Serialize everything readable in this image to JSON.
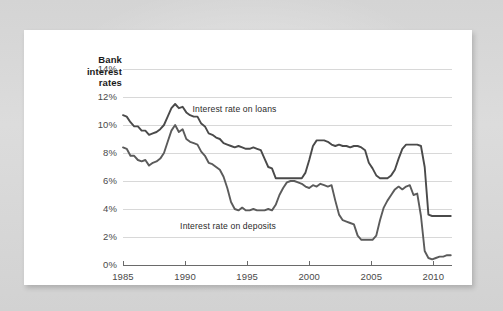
{
  "page": {
    "background_color": "#d9d9d9",
    "paper_color": "#ffffff"
  },
  "chart_data": {
    "type": "line",
    "title": "Bank interest rates",
    "title_lines": [
      "Bank",
      "interest",
      "rates"
    ],
    "xlabel": "",
    "ylabel": "",
    "xlim": [
      1985,
      2011.5
    ],
    "ylim": [
      0,
      14
    ],
    "grid": true,
    "grid_axis": "y",
    "legend_position": "inline-annotations",
    "y_ticks": [
      0,
      2,
      4,
      6,
      8,
      10,
      12,
      14
    ],
    "y_tick_labels": [
      "0%",
      "2%",
      "4%",
      "6%",
      "8%",
      "10%",
      "12%",
      "14%"
    ],
    "x_ticks": [
      1985,
      1990,
      1995,
      2000,
      2005,
      2010
    ],
    "x_tick_labels": [
      "1985",
      "1990",
      "1995",
      "2000",
      "2005",
      "2010"
    ],
    "annotations": [
      {
        "text": "Interest rate on loans",
        "x": 1990.6,
        "y": 11.1
      },
      {
        "text": "Interest rate on deposits",
        "x": 1989.6,
        "y": 2.7
      }
    ],
    "series": [
      {
        "name": "Interest rate on loans",
        "color": "#4a4a4a",
        "x": [
          1985.0,
          1985.3,
          1985.6,
          1985.9,
          1986.2,
          1986.5,
          1986.8,
          1987.1,
          1987.4,
          1987.7,
          1988.0,
          1988.3,
          1988.6,
          1988.9,
          1989.2,
          1989.5,
          1989.8,
          1990.1,
          1990.4,
          1990.7,
          1991.0,
          1991.3,
          1991.6,
          1991.9,
          1992.2,
          1992.5,
          1992.8,
          1993.1,
          1993.4,
          1993.7,
          1994.0,
          1994.3,
          1994.6,
          1994.9,
          1995.2,
          1995.5,
          1995.8,
          1996.1,
          1996.4,
          1996.7,
          1997.0,
          1997.3,
          1997.6,
          1997.9,
          1998.2,
          1998.5,
          1998.8,
          1999.1,
          1999.4,
          1999.7,
          2000.0,
          2000.3,
          2000.6,
          2000.9,
          2001.2,
          2001.5,
          2001.8,
          2002.1,
          2002.4,
          2002.7,
          2003.0,
          2003.3,
          2003.6,
          2003.9,
          2004.2,
          2004.5,
          2004.8,
          2005.1,
          2005.4,
          2005.7,
          2006.0,
          2006.3,
          2006.6,
          2006.9,
          2007.2,
          2007.5,
          2007.8,
          2008.1,
          2008.4,
          2008.7,
          2009.0,
          2009.3,
          2009.6,
          2009.9,
          2010.2,
          2010.5,
          2010.8,
          2011.1,
          2011.4
        ],
        "y": [
          10.7,
          10.6,
          10.2,
          9.9,
          9.9,
          9.6,
          9.6,
          9.3,
          9.4,
          9.5,
          9.7,
          10.0,
          10.6,
          11.2,
          11.5,
          11.2,
          11.3,
          10.9,
          10.7,
          10.6,
          10.6,
          10.1,
          9.9,
          9.4,
          9.3,
          9.1,
          9.0,
          8.7,
          8.6,
          8.5,
          8.4,
          8.5,
          8.4,
          8.3,
          8.3,
          8.4,
          8.3,
          8.2,
          7.6,
          7.0,
          6.9,
          6.2,
          6.2,
          6.2,
          6.2,
          6.2,
          6.2,
          6.2,
          6.2,
          6.6,
          7.5,
          8.5,
          8.9,
          8.9,
          8.9,
          8.8,
          8.6,
          8.5,
          8.6,
          8.5,
          8.5,
          8.4,
          8.5,
          8.5,
          8.4,
          8.2,
          7.3,
          6.9,
          6.4,
          6.2,
          6.2,
          6.2,
          6.4,
          6.8,
          7.6,
          8.3,
          8.6,
          8.6,
          8.6,
          8.6,
          8.5,
          7.0,
          3.6,
          3.5,
          3.5,
          3.5,
          3.5,
          3.5,
          3.5
        ]
      },
      {
        "name": "Interest rate on deposits",
        "color": "#5b5b5b",
        "x": [
          1985.0,
          1985.3,
          1985.6,
          1985.9,
          1986.2,
          1986.5,
          1986.8,
          1987.1,
          1987.4,
          1987.7,
          1988.0,
          1988.3,
          1988.6,
          1988.9,
          1989.2,
          1989.5,
          1989.8,
          1990.1,
          1990.4,
          1990.7,
          1991.0,
          1991.3,
          1991.6,
          1991.9,
          1992.2,
          1992.5,
          1992.8,
          1993.1,
          1993.4,
          1993.7,
          1994.0,
          1994.3,
          1994.6,
          1994.9,
          1995.2,
          1995.5,
          1995.8,
          1996.1,
          1996.4,
          1996.7,
          1997.0,
          1997.3,
          1997.6,
          1997.9,
          1998.2,
          1998.5,
          1998.8,
          1999.1,
          1999.4,
          1999.7,
          2000.0,
          2000.3,
          2000.6,
          2000.9,
          2001.2,
          2001.5,
          2001.8,
          2002.1,
          2002.4,
          2002.7,
          2003.0,
          2003.3,
          2003.6,
          2003.9,
          2004.2,
          2004.5,
          2004.8,
          2005.1,
          2005.4,
          2005.7,
          2006.0,
          2006.3,
          2006.6,
          2006.9,
          2007.2,
          2007.5,
          2007.8,
          2008.1,
          2008.4,
          2008.7,
          2009.0,
          2009.3,
          2009.6,
          2009.9,
          2010.2,
          2010.5,
          2010.8,
          2011.1,
          2011.4
        ],
        "y": [
          8.4,
          8.3,
          7.8,
          7.8,
          7.5,
          7.4,
          7.5,
          7.1,
          7.3,
          7.4,
          7.6,
          8.0,
          8.8,
          9.6,
          10.0,
          9.5,
          9.7,
          9.0,
          8.8,
          8.7,
          8.6,
          8.1,
          7.8,
          7.3,
          7.2,
          7.0,
          6.8,
          6.3,
          5.5,
          4.5,
          4.0,
          3.9,
          4.1,
          3.9,
          3.9,
          4.0,
          3.9,
          3.9,
          3.9,
          4.0,
          3.9,
          4.3,
          5.0,
          5.5,
          5.9,
          6.0,
          6.0,
          5.9,
          5.8,
          5.6,
          5.5,
          5.7,
          5.6,
          5.8,
          5.7,
          5.6,
          5.7,
          4.6,
          3.6,
          3.2,
          3.1,
          3.0,
          2.9,
          2.1,
          1.8,
          1.8,
          1.8,
          1.8,
          2.1,
          3.2,
          4.1,
          4.6,
          5.0,
          5.4,
          5.6,
          5.4,
          5.6,
          5.7,
          5.0,
          5.1,
          3.5,
          1.0,
          0.5,
          0.4,
          0.5,
          0.6,
          0.6,
          0.7,
          0.7
        ]
      }
    ]
  }
}
